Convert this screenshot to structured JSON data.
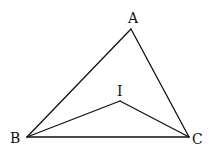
{
  "figure": {
    "type": "geometry-diagram",
    "points": {
      "A": {
        "label": "A",
        "x": 131,
        "y": 29,
        "lx": 128,
        "ly": 23
      },
      "B": {
        "label": "B",
        "x": 27,
        "y": 137,
        "lx": 10,
        "ly": 143
      },
      "C": {
        "label": "C",
        "x": 189,
        "y": 137,
        "lx": 192,
        "ly": 144
      },
      "I": {
        "label": "I",
        "x": 120,
        "y": 101,
        "lx": 117,
        "ly": 96
      }
    },
    "segments": [
      [
        "A",
        "B"
      ],
      [
        "A",
        "C"
      ],
      [
        "B",
        "C"
      ],
      [
        "I",
        "B"
      ],
      [
        "I",
        "C"
      ]
    ],
    "stroke_color": "#111111"
  }
}
